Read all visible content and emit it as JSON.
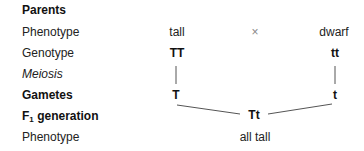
{
  "labels": {
    "parents": "Parents",
    "phenotype": "Phenotype",
    "genotype": "Genotype",
    "meiosis": "Meiosis",
    "gametes": "Gametes",
    "f1_prefix": "F",
    "f1_sub": "1",
    "f1_suffix": " generation",
    "f1_phenotype": "Phenotype"
  },
  "parent1": {
    "phenotype": "tall",
    "genotype": "TT",
    "gamete": "T"
  },
  "parent2": {
    "phenotype": "dwarf",
    "genotype": "tt",
    "gamete": "t"
  },
  "cross_symbol": "×",
  "offspring": {
    "genotype": "Tt",
    "phenotype": "all tall"
  }
}
